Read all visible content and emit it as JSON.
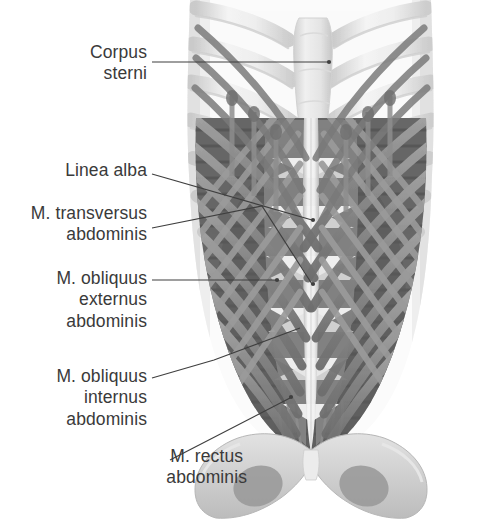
{
  "figure": {
    "background_color": "#ffffff",
    "text_color": "#3a3a3a",
    "leader_color": "#3f3f3f"
  },
  "labels": [
    {
      "id": "corpus",
      "text": "Corpus\nsterni",
      "name": "label-corpus-sterni"
    },
    {
      "id": "linea",
      "text": "Linea alba",
      "name": "label-linea-alba"
    },
    {
      "id": "trans",
      "text": "M. transversus\nabdominis",
      "name": "label-m-transversus-abdominis"
    },
    {
      "id": "oblext",
      "text": "M. obliquus\nexternus\nabdominis",
      "name": "label-m-obliquus-externus-abdominis"
    },
    {
      "id": "oblint",
      "text": "M. obliquus\ninternus\nabdominis",
      "name": "label-m-obliquus-internus-abdominis"
    },
    {
      "id": "rectus",
      "text": "M. rectus\nabdominis",
      "name": "label-m-rectus-abdominis"
    }
  ],
  "anatomy": {
    "structures": [
      "sternum",
      "rib cage",
      "costal cartilage",
      "linea alba",
      "m. rectus abdominis",
      "m. obliquus externus abdominis",
      "m. obliquus internus abdominis",
      "m. transversus abdominis",
      "pelvis",
      "obturator foramen"
    ],
    "palette": {
      "bone_light": "#f2f2f2",
      "bone_mid": "#dcdcdc",
      "bone_shadow": "#c2c2c2",
      "muscle_dark": "#5a5a5a",
      "muscle_band": "#8c8c8c",
      "muscle_band_light": "#b4b4b4",
      "aponeurosis": "#efefef"
    }
  }
}
